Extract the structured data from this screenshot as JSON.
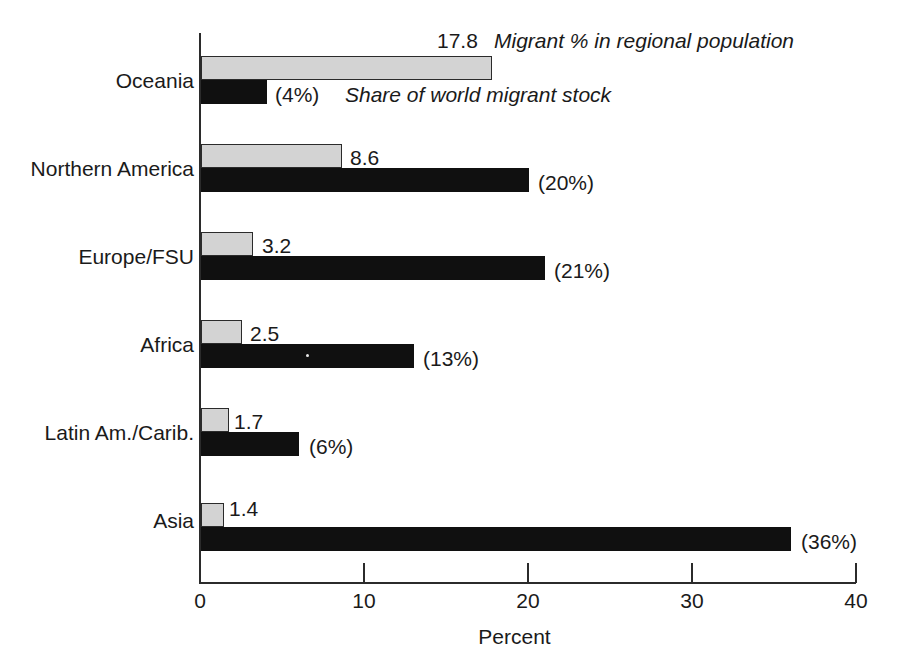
{
  "chart_data": {
    "type": "bar",
    "orientation": "horizontal",
    "title": "",
    "xlabel": "Percent",
    "ylabel": "",
    "xlim": [
      0,
      40
    ],
    "xticks": [
      0,
      10,
      20,
      30,
      40
    ],
    "xtick_labels": [
      "0",
      "10",
      "20",
      "30",
      "40"
    ],
    "grid": false,
    "legend_position": "inline-annotations-top-group",
    "categories": [
      "Oceania",
      "Northern America",
      "Europe/FSU",
      "Africa",
      "Latin Am./Carib.",
      "Asia"
    ],
    "series": [
      {
        "name": "Migrant % in regional population",
        "style": "light-gray-filled-outlined",
        "color": "#d3d3d3",
        "values": [
          17.8,
          8.6,
          3.2,
          2.5,
          1.7,
          1.4
        ],
        "value_labels": [
          "17.8",
          "8.6",
          "3.2",
          "2.5",
          "1.7",
          "1.4"
        ]
      },
      {
        "name": "Share of world migrant stock",
        "style": "solid-black",
        "color": "#101010",
        "values": [
          4,
          20,
          21,
          13,
          6,
          36
        ],
        "value_labels": [
          "(4%)",
          "(20%)",
          "(21%)",
          "(13%)",
          "(6%)",
          "(36%)"
        ]
      }
    ]
  },
  "axis": {
    "x_title": "Percent",
    "ticks": [
      "0",
      "10",
      "20",
      "30",
      "40"
    ]
  },
  "legend": {
    "light_series_note": "Migrant % in regional population",
    "dark_series_note": "Share of world migrant stock"
  },
  "colors": {
    "light_bar": "#d3d3d3",
    "dark_bar": "#101010",
    "axis": "#2b2b2b",
    "text": "#1a1a1a",
    "background": "#ffffff"
  }
}
